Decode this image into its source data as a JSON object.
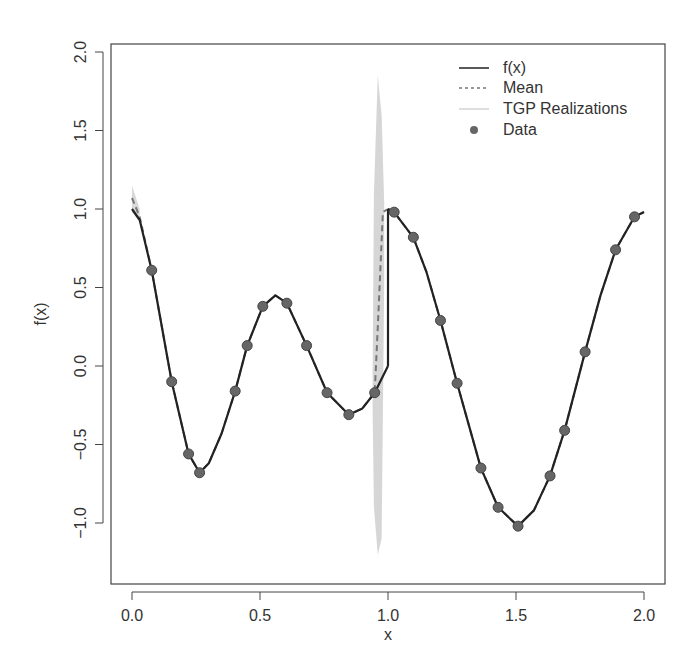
{
  "chart_data": {
    "type": "line",
    "title": "",
    "xlabel": "x",
    "ylabel": "f(x)",
    "xlim": [
      -0.08,
      2.08
    ],
    "ylim": [
      -1.4,
      2.05
    ],
    "x_ticks": [
      0.0,
      0.5,
      1.0,
      1.5,
      2.0
    ],
    "x_tick_labels": [
      "0.0",
      "0.5",
      "1.0",
      "1.5",
      "2.0"
    ],
    "y_ticks": [
      -1.0,
      -0.5,
      0.0,
      0.5,
      1.0,
      1.5,
      2.0
    ],
    "y_tick_labels": [
      "-1.0",
      "-0.5",
      "0.0",
      "0.5",
      "1.0",
      "1.5",
      "2.0"
    ],
    "grid": false,
    "legend_position": "top-right",
    "legend": [
      {
        "label": "f(x)",
        "style": "solid",
        "color": "#222222"
      },
      {
        "label": "Mean",
        "style": "dashed",
        "color": "#777777"
      },
      {
        "label": "TGP Realizations",
        "style": "solid",
        "color": "#d3d3d3"
      },
      {
        "label": "Data",
        "style": "point",
        "color": "#666666"
      }
    ],
    "series": [
      {
        "name": "f(x)",
        "segments": [
          [
            [
              0.0,
              1.0
            ],
            [
              0.03,
              0.93
            ],
            [
              0.077,
              0.61
            ],
            [
              0.155,
              -0.1
            ],
            [
              0.221,
              -0.56
            ],
            [
              0.264,
              -0.68
            ],
            [
              0.3,
              -0.62
            ],
            [
              0.35,
              -0.43
            ],
            [
              0.403,
              -0.16
            ],
            [
              0.45,
              0.13
            ],
            [
              0.511,
              0.38
            ],
            [
              0.56,
              0.45
            ],
            [
              0.605,
              0.4
            ],
            [
              0.682,
              0.13
            ],
            [
              0.762,
              -0.17
            ],
            [
              0.847,
              -0.31
            ],
            [
              0.9,
              -0.27
            ],
            [
              0.948,
              -0.17
            ],
            [
              1.0,
              0.0
            ]
          ],
          [
            [
              1.0,
              1.0
            ],
            [
              1.024,
              0.98
            ],
            [
              1.099,
              0.82
            ],
            [
              1.15,
              0.6
            ],
            [
              1.205,
              0.29
            ],
            [
              1.27,
              -0.11
            ],
            [
              1.363,
              -0.65
            ],
            [
              1.43,
              -0.9
            ],
            [
              1.508,
              -1.02
            ],
            [
              1.57,
              -0.92
            ],
            [
              1.633,
              -0.7
            ],
            [
              1.69,
              -0.41
            ],
            [
              1.77,
              0.09
            ],
            [
              1.83,
              0.45
            ],
            [
              1.889,
              0.74
            ],
            [
              1.963,
              0.95
            ],
            [
              2.0,
              0.98
            ]
          ]
        ]
      },
      {
        "name": "Mean",
        "segments": [
          [
            [
              0.0,
              1.07
            ],
            [
              0.03,
              0.95
            ],
            [
              0.077,
              0.61
            ],
            [
              0.155,
              -0.1
            ],
            [
              0.221,
              -0.56
            ],
            [
              0.264,
              -0.68
            ],
            [
              0.3,
              -0.62
            ],
            [
              0.35,
              -0.43
            ],
            [
              0.403,
              -0.16
            ],
            [
              0.45,
              0.13
            ],
            [
              0.511,
              0.38
            ],
            [
              0.56,
              0.45
            ],
            [
              0.605,
              0.4
            ],
            [
              0.682,
              0.13
            ],
            [
              0.762,
              -0.17
            ],
            [
              0.847,
              -0.31
            ],
            [
              0.9,
              -0.27
            ],
            [
              0.948,
              -0.17
            ],
            [
              0.96,
              0.25
            ],
            [
              0.98,
              0.98
            ],
            [
              1.0,
              1.0
            ]
          ],
          [
            [
              1.0,
              1.0
            ],
            [
              1.024,
              0.98
            ],
            [
              1.099,
              0.82
            ],
            [
              1.15,
              0.6
            ],
            [
              1.205,
              0.29
            ],
            [
              1.27,
              -0.11
            ],
            [
              1.363,
              -0.65
            ],
            [
              1.43,
              -0.9
            ],
            [
              1.508,
              -1.02
            ],
            [
              1.57,
              -0.92
            ],
            [
              1.633,
              -0.7
            ],
            [
              1.69,
              -0.41
            ],
            [
              1.77,
              0.09
            ],
            [
              1.83,
              0.45
            ],
            [
              1.889,
              0.74
            ],
            [
              1.963,
              0.95
            ],
            [
              2.0,
              0.98
            ]
          ]
        ]
      },
      {
        "name": "TGP Realizations",
        "band": [
          {
            "x": 0.0,
            "low": 0.98,
            "high": 1.15
          },
          {
            "x": 0.03,
            "low": 0.92,
            "high": 1.0
          },
          {
            "x": 0.94,
            "low": -0.3,
            "high": -0.05
          },
          {
            "x": 0.945,
            "low": -0.9,
            "high": 1.1
          },
          {
            "x": 0.96,
            "low": -1.2,
            "high": 1.85
          },
          {
            "x": 0.975,
            "low": -1.1,
            "high": 1.6
          },
          {
            "x": 0.985,
            "low": 0.5,
            "high": 1.05
          }
        ]
      },
      {
        "name": "Data",
        "x": [
          0.077,
          0.155,
          0.221,
          0.264,
          0.403,
          0.45,
          0.511,
          0.605,
          0.682,
          0.762,
          0.847,
          0.948,
          1.024,
          1.099,
          1.205,
          1.27,
          1.363,
          1.43,
          1.508,
          1.633,
          1.69,
          1.77,
          1.889,
          1.963
        ],
        "y": [
          0.61,
          -0.1,
          -0.56,
          -0.68,
          -0.16,
          0.13,
          0.38,
          0.4,
          0.13,
          -0.17,
          -0.31,
          -0.17,
          0.98,
          0.82,
          0.29,
          -0.11,
          -0.65,
          -0.9,
          -1.02,
          -0.7,
          -0.41,
          0.09,
          0.74,
          0.95
        ]
      }
    ]
  }
}
